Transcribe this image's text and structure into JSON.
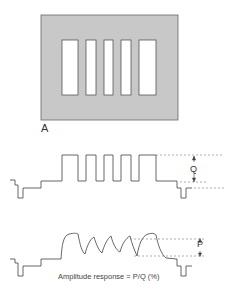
{
  "figure": {
    "panel_label": "A",
    "pattern": {
      "description": "Test pattern: gray field with five white vertical bars of varying width",
      "background_color": "#c8c8c8",
      "bar_color": "#ffffff",
      "outline_color": "#555555",
      "bars": 5
    },
    "waveform_input": {
      "description": "Ideal square-wave video signal from the bar pattern",
      "amplitude_label": "Q"
    },
    "waveform_output": {
      "description": "Degraded output waveform with rounded/decaying peaks",
      "amplitude_label": "P"
    },
    "caption": "Amplitude response = P/Q (%)"
  }
}
